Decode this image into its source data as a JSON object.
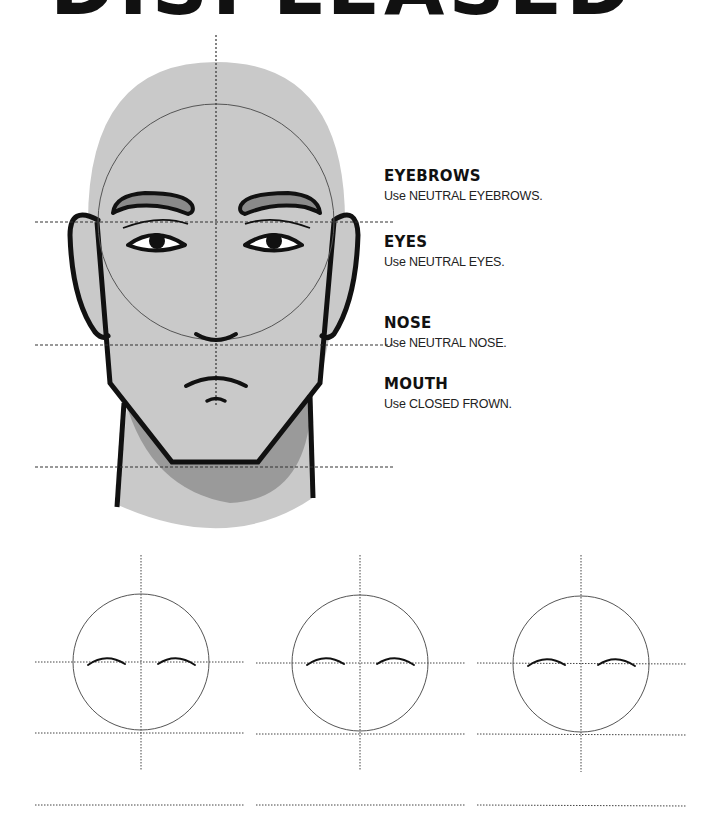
{
  "page": {
    "title": "DISPLEASED"
  },
  "features": [
    {
      "heading": "EYEBROWS",
      "description": "Use NEUTRAL EYEBROWS."
    },
    {
      "heading": "EYES",
      "description": "Use NEUTRAL EYES."
    },
    {
      "heading": "NOSE",
      "description": "Use NEUTRAL NOSE."
    },
    {
      "heading": "MOUTH",
      "description": "Use CLOSED FROWN."
    }
  ],
  "illustration": {
    "subject": "front-view face construction guide",
    "colors": {
      "skin": "#c9c9c9",
      "shadow": "#9a9a9a",
      "eyebrow_fill": "#8a8a8a",
      "outline": "#111111",
      "guide_line": "#444444"
    }
  },
  "practice": {
    "count": 3,
    "items": [
      {
        "label": "practice-circle-1"
      },
      {
        "label": "practice-circle-2"
      },
      {
        "label": "practice-circle-3"
      }
    ]
  }
}
